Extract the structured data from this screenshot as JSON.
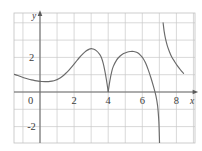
{
  "figure": {
    "background_color": "#ffffff",
    "grid_color": "#c9c9c9",
    "axis_color": "#6d6d6d",
    "curve_color": "#6a6a6a",
    "width": 202,
    "height": 151
  },
  "axis_names": {
    "x": "x",
    "y": "y"
  },
  "ticks": {
    "origin_label": "0",
    "x": [
      {
        "value": 2,
        "label": "2"
      },
      {
        "value": 4,
        "label": "4"
      },
      {
        "value": 6,
        "label": "6"
      },
      {
        "value": 8,
        "label": "8"
      }
    ],
    "y": [
      {
        "value": 2,
        "label": "2"
      },
      {
        "value": -2,
        "label": "-2"
      }
    ]
  },
  "chart_data": {
    "type": "line",
    "title": "",
    "xlabel": "x",
    "ylabel": "y",
    "xlim": [
      -1.5,
      9.1
    ],
    "ylim": [
      -3.6,
      4.0
    ],
    "grid": true,
    "grid_spacing": {
      "x": 1,
      "y": 1
    },
    "legend": null,
    "axis_arrows": {
      "x": "right",
      "y": "up"
    },
    "annotations": [
      {
        "kind": "zero-touch",
        "x": 4,
        "y": 0,
        "note": "curve touches x-axis at x=4"
      },
      {
        "kind": "vertical-asymptote",
        "x": 7,
        "note": "curve diverges to -inf from left, +inf from right"
      },
      {
        "kind": "x-intercept",
        "x": 6.8,
        "y": 0
      }
    ],
    "series": [
      {
        "name": "branch-left",
        "points": [
          [
            -1.5,
            1.02
          ],
          [
            -1.3,
            0.95
          ],
          [
            -1.1,
            0.88
          ],
          [
            -0.9,
            0.81
          ],
          [
            -0.7,
            0.75
          ],
          [
            -0.5,
            0.7
          ],
          [
            -0.3,
            0.66
          ],
          [
            -0.1,
            0.63
          ],
          [
            0.1,
            0.61
          ],
          [
            0.3,
            0.6
          ],
          [
            0.5,
            0.6
          ],
          [
            0.7,
            0.63
          ],
          [
            0.9,
            0.68
          ],
          [
            1.1,
            0.77
          ],
          [
            1.3,
            0.9
          ],
          [
            1.5,
            1.07
          ],
          [
            1.7,
            1.27
          ],
          [
            1.9,
            1.5
          ],
          [
            2.1,
            1.74
          ],
          [
            2.3,
            1.98
          ],
          [
            2.5,
            2.19
          ],
          [
            2.7,
            2.37
          ],
          [
            2.9,
            2.48
          ],
          [
            3.0,
            2.51
          ],
          [
            3.1,
            2.49
          ],
          [
            3.3,
            2.39
          ],
          [
            3.5,
            2.18
          ],
          [
            3.6,
            1.99
          ],
          [
            3.7,
            1.68
          ],
          [
            3.8,
            1.24
          ],
          [
            3.9,
            0.68
          ],
          [
            4.0,
            0.02
          ]
        ]
      },
      {
        "name": "branch-middle",
        "points": [
          [
            4.0,
            0.02
          ],
          [
            4.1,
            0.66
          ],
          [
            4.2,
            1.15
          ],
          [
            4.3,
            1.48
          ],
          [
            4.5,
            1.86
          ],
          [
            4.7,
            2.08
          ],
          [
            4.9,
            2.22
          ],
          [
            5.1,
            2.3
          ],
          [
            5.3,
            2.34
          ],
          [
            5.5,
            2.34
          ],
          [
            5.7,
            2.28
          ],
          [
            5.9,
            2.12
          ],
          [
            6.05,
            1.94
          ],
          [
            6.2,
            1.66
          ],
          [
            6.35,
            1.28
          ],
          [
            6.5,
            0.84
          ],
          [
            6.65,
            0.34
          ],
          [
            6.8,
            -0.22
          ],
          [
            6.9,
            -0.82
          ],
          [
            6.97,
            -1.7
          ],
          [
            7.0,
            -2.55
          ],
          [
            7.02,
            -3.3
          ],
          [
            7.03,
            -3.62
          ]
        ]
      },
      {
        "name": "branch-right",
        "points": [
          [
            7.22,
            4.0
          ],
          [
            7.28,
            3.52
          ],
          [
            7.36,
            3.08
          ],
          [
            7.46,
            2.7
          ],
          [
            7.58,
            2.36
          ],
          [
            7.72,
            2.04
          ],
          [
            7.88,
            1.78
          ],
          [
            8.04,
            1.54
          ],
          [
            8.2,
            1.33
          ],
          [
            8.34,
            1.16
          ],
          [
            8.42,
            1.08
          ]
        ]
      }
    ]
  }
}
